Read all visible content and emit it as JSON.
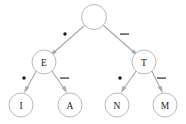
{
  "figure": {
    "background_color": "#ffffff",
    "node_fill": "#ffffff",
    "node_stroke": "#b9b9bd",
    "edge_color": "#a8a8ae",
    "label_color": "#1c1c1c",
    "dot_color": "#1a1a1a",
    "dash_color": "#5e5e64"
  },
  "nodes": [
    {
      "id": "root",
      "label": "",
      "cx": 94,
      "cy": 17,
      "r": 12.5
    },
    {
      "id": "E",
      "label": "E",
      "cx": 44,
      "cy": 62,
      "r": 12.0
    },
    {
      "id": "T",
      "label": "T",
      "cx": 144,
      "cy": 62,
      "r": 12.0
    },
    {
      "id": "I",
      "label": "I",
      "cx": 21,
      "cy": 105,
      "r": 12.0
    },
    {
      "id": "A",
      "label": "A",
      "cx": 70,
      "cy": 105,
      "r": 12.0
    },
    {
      "id": "N",
      "label": "N",
      "cx": 117,
      "cy": 105,
      "r": 12.0
    },
    {
      "id": "M",
      "label": "M",
      "cx": 165,
      "cy": 105,
      "r": 12.0
    }
  ],
  "edges": [
    {
      "id": "root-E",
      "from": "root",
      "to": "E",
      "symbol": "dot",
      "symbol_text": "•",
      "label_x": 65,
      "label_y": 35
    },
    {
      "id": "root-T",
      "from": "root",
      "to": "T",
      "symbol": "dash",
      "symbol_text": "—",
      "label_x": 124,
      "label_y": 35
    },
    {
      "id": "E-I",
      "from": "E",
      "to": "I",
      "symbol": "dot",
      "symbol_text": "•",
      "label_x": 24,
      "label_y": 79
    },
    {
      "id": "E-A",
      "from": "E",
      "to": "A",
      "symbol": "dash",
      "symbol_text": "—",
      "label_x": 64,
      "label_y": 79
    },
    {
      "id": "T-N",
      "from": "T",
      "to": "N",
      "symbol": "dot",
      "symbol_text": "•",
      "label_x": 120,
      "label_y": 79
    },
    {
      "id": "T-M",
      "from": "T",
      "to": "M",
      "symbol": "dash",
      "symbol_text": "—",
      "label_x": 161,
      "label_y": 79
    }
  ],
  "legend": {
    "dot_meaning": "dot",
    "dash_meaning": "dash"
  }
}
